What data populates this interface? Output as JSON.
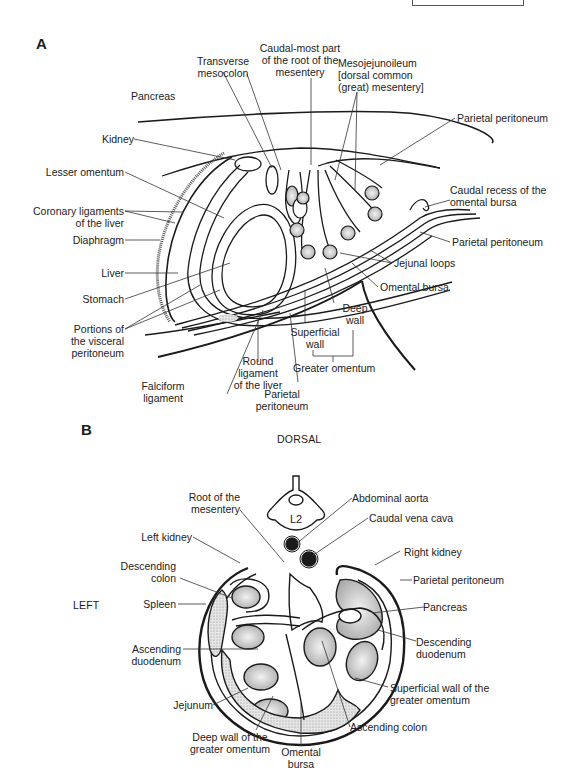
{
  "figure": {
    "panel_a": {
      "letter": "A",
      "labels": {
        "transverse_mesocolon": "Transverse\nmesocolon",
        "caudal_root": "Caudal-most part\nof the root of the\nmesentery",
        "mesojejunoileum": "Mesojejunoileum\n[dorsal common\n(great) mesentery]",
        "pancreas": "Pancreas",
        "parietal_peritoneum_top": "Parietal peritoneum",
        "kidney": "Kidney",
        "lesser_omentum": "Lesser omentum",
        "caudal_recess": "Caudal recess of the\nomental bursa",
        "coronary_ligaments": "Coronary ligaments\nof the liver",
        "parietal_peritoneum_right": "Parietal peritoneum",
        "diaphragm": "Diaphragm",
        "jejunal_loops": "Jejunal loops",
        "liver": "Liver",
        "omental_bursa": "Omental bursa",
        "stomach": "Stomach",
        "deep_wall": "Deep\nwall",
        "visceral_peritoneum": "Portions of\nthe visceral\nperitoneum",
        "superficial_wall": "Superficial\nwall",
        "round_ligament": "Round\nligament\nof the liver",
        "greater_omentum": "Greater omentum",
        "falciform_ligament": "Falciform\nligament",
        "parietal_peritoneum_bottom": "Parietal\nperitoneum"
      }
    },
    "panel_b": {
      "letter": "B",
      "orientation": {
        "dorsal": "DORSAL",
        "left": "LEFT"
      },
      "vertebra_label": "L2",
      "labels": {
        "root_mesentery": "Root of the\nmesentery",
        "abdominal_aorta": "Abdominal aorta",
        "caudal_vena_cava": "Caudal vena cava",
        "left_kidney": "Left kidney",
        "right_kidney": "Right kidney",
        "descending_colon": "Descending\ncolon",
        "parietal_peritoneum": "Parietal peritoneum",
        "spleen": "Spleen",
        "pancreas": "Pancreas",
        "ascending_duodenum": "Ascending\nduodenum",
        "descending_duodenum": "Descending\nduodenum",
        "jejunum": "Jejunum",
        "superficial_wall": "Superficial wall of the\ngreater omentum",
        "deep_wall": "Deep wall of the\ngreater omentum",
        "ascending_colon": "Ascending colon",
        "omental_bursa": "Omental\nbursa"
      }
    },
    "colors": {
      "ink": "#1a1a1a",
      "stipple": "#bdbdbd",
      "background": "#ffffff"
    }
  }
}
